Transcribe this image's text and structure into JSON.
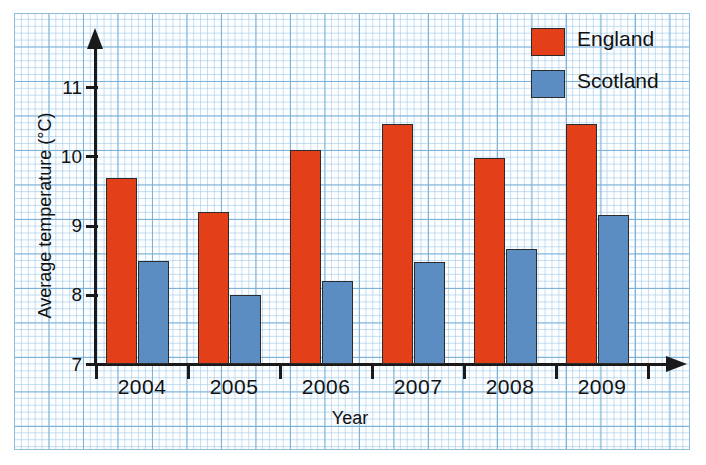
{
  "chart_data": {
    "type": "bar",
    "title": "",
    "xlabel": "Year",
    "ylabel": "Average temperature (°C)",
    "categories": [
      "2004",
      "2005",
      "2006",
      "2007",
      "2008",
      "2009"
    ],
    "series": [
      {
        "name": "England",
        "color": "#e3401a",
        "values": [
          9.7,
          9.2,
          10.1,
          10.48,
          9.98,
          10.48
        ]
      },
      {
        "name": "Scotland",
        "color": "#5b8cc2",
        "values": [
          8.5,
          8.0,
          8.2,
          8.48,
          8.67,
          9.16
        ]
      }
    ],
    "ylim": [
      7,
      11.5
    ],
    "ytick_labels": [
      "11",
      "10",
      "9",
      "8",
      "7"
    ],
    "ytick_values": [
      11,
      10,
      9,
      8,
      7
    ],
    "grid": true,
    "legend_position": "top-right"
  },
  "legend": {
    "entries": [
      {
        "label": "England",
        "color": "#e3401a"
      },
      {
        "label": "Scotland",
        "color": "#5b8cc2"
      }
    ]
  },
  "axes": {
    "x_title": "Year",
    "y_title": "Average temperature (°C)"
  },
  "colors": {
    "england": "#e3401a",
    "scotland": "#5b8cc2",
    "grid_minor": "#96c3e4",
    "grid_major": "#78afd7",
    "axis": "#1a1a1a",
    "paper": "#fdfeff"
  }
}
